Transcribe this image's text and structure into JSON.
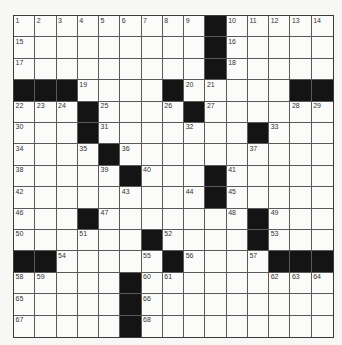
{
  "puzzle": {
    "rows": 15,
    "cols": 15,
    "colors": {
      "black_square": "#141414",
      "white_square": "#fbfbfa",
      "grid_line": "#5a5a5a"
    },
    "grid": [
      [
        "1",
        "2",
        "3",
        "4",
        "5",
        "6",
        "7",
        "8",
        "9",
        "#",
        "10",
        "11",
        "12",
        "13",
        "14"
      ],
      [
        "15",
        "",
        "",
        "",
        "",
        "",
        "",
        "",
        "",
        "#",
        "16",
        "",
        "",
        "",
        ""
      ],
      [
        "17",
        "",
        "",
        "",
        "",
        "",
        "",
        "",
        "",
        "#",
        "18",
        "",
        "",
        "",
        ""
      ],
      [
        "#",
        "#",
        "#",
        "19",
        "",
        "",
        "",
        "#",
        "20",
        "21",
        "",
        "",
        "",
        "#",
        "#"
      ],
      [
        "22",
        "23",
        "24",
        "#",
        "25",
        "",
        "",
        "26",
        "#",
        "27",
        "",
        "",
        "",
        "28",
        "29"
      ],
      [
        "30",
        "",
        "",
        "#",
        "31",
        "",
        "",
        "",
        "32",
        "",
        "",
        "#",
        "33",
        "",
        ""
      ],
      [
        "34",
        "",
        "",
        "35",
        "#",
        "36",
        "",
        "",
        "",
        "",
        "",
        "37",
        "",
        "",
        ""
      ],
      [
        "38",
        "",
        "",
        "",
        "39",
        "#",
        "40",
        "",
        "",
        "#",
        "41",
        "",
        "",
        "",
        ""
      ],
      [
        "42",
        "",
        "",
        "",
        "",
        "43",
        "",
        "",
        "44",
        "#",
        "45",
        "",
        "",
        "",
        ""
      ],
      [
        "46",
        "",
        "",
        "#",
        "47",
        "",
        "",
        "",
        "",
        "",
        "48",
        "#",
        "49",
        "",
        ""
      ],
      [
        "50",
        "",
        "",
        "51",
        "",
        "",
        "#",
        "52",
        "",
        "",
        "",
        "#",
        "53",
        "",
        ""
      ],
      [
        "#",
        "#",
        "54",
        "",
        "",
        "",
        "55",
        "#",
        "56",
        "",
        "",
        "57",
        "#",
        "#",
        "#"
      ],
      [
        "58",
        "59",
        "",
        "",
        "",
        "#",
        "60",
        "61",
        "",
        "",
        "",
        "",
        "62",
        "63",
        "64"
      ],
      [
        "65",
        "",
        "",
        "",
        "",
        "#",
        "66",
        "",
        "",
        "",
        "",
        "",
        "",
        "",
        ""
      ],
      [
        "67",
        "",
        "",
        "",
        "",
        "#",
        "68",
        "",
        "",
        "",
        "",
        "",
        "",
        "",
        ""
      ]
    ]
  }
}
